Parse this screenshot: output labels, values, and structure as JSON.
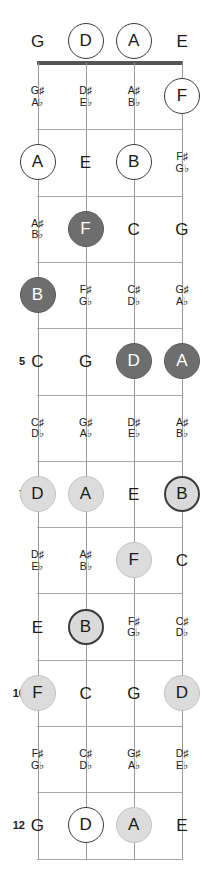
{
  "diagram": {
    "instrument": "4-string bass",
    "num_strings": 4,
    "num_frets": 12,
    "colors": {
      "nut": "#555555",
      "fret_line": "#a8a8a8",
      "string": "#9a9a9a",
      "text": "#1a1a1a",
      "marker_open_fill": "#ffffff",
      "marker_light_fill": "#dcdcdc",
      "marker_dark_fill": "#6e6e6e",
      "marker_border_dark": "#3a3a3a",
      "marker_dark_text": "#ffffff"
    }
  },
  "open_strings": [
    {
      "label": "G",
      "style": "plain"
    },
    {
      "label": "D",
      "style": "open"
    },
    {
      "label": "A",
      "style": "open"
    },
    {
      "label": "E",
      "style": "plain"
    }
  ],
  "fret_numbers": [
    {
      "fret": 5,
      "label": "5"
    },
    {
      "fret": 7,
      "label": "7"
    },
    {
      "fret": 10,
      "label": "10"
    },
    {
      "fret": 12,
      "label": "12"
    }
  ],
  "frets": [
    {
      "fret": 1,
      "notes": [
        {
          "string": 1,
          "label": "G♯\nA♭",
          "style": "accidental"
        },
        {
          "string": 2,
          "label": "D♯\nE♭",
          "style": "accidental"
        },
        {
          "string": 3,
          "label": "A♯\nB♭",
          "style": "accidental"
        },
        {
          "string": 4,
          "label": "F",
          "style": "open"
        }
      ]
    },
    {
      "fret": 2,
      "notes": [
        {
          "string": 1,
          "label": "A",
          "style": "open"
        },
        {
          "string": 2,
          "label": "E",
          "style": "plain"
        },
        {
          "string": 3,
          "label": "B",
          "style": "open"
        },
        {
          "string": 4,
          "label": "F♯\nG♭",
          "style": "accidental"
        }
      ]
    },
    {
      "fret": 3,
      "notes": [
        {
          "string": 1,
          "label": "A♯\nB♭",
          "style": "accidental"
        },
        {
          "string": 2,
          "label": "F",
          "style": "dark"
        },
        {
          "string": 3,
          "label": "C",
          "style": "plain"
        },
        {
          "string": 4,
          "label": "G",
          "style": "plain"
        }
      ]
    },
    {
      "fret": 4,
      "notes": [
        {
          "string": 1,
          "label": "B",
          "style": "dark"
        },
        {
          "string": 2,
          "label": "F♯\nG♭",
          "style": "accidental"
        },
        {
          "string": 3,
          "label": "C♯\nD♭",
          "style": "accidental"
        },
        {
          "string": 4,
          "label": "G♯\nA♭",
          "style": "accidental"
        }
      ]
    },
    {
      "fret": 5,
      "notes": [
        {
          "string": 1,
          "label": "C",
          "style": "plain"
        },
        {
          "string": 2,
          "label": "G",
          "style": "plain"
        },
        {
          "string": 3,
          "label": "D",
          "style": "dark"
        },
        {
          "string": 4,
          "label": "A",
          "style": "dark"
        }
      ]
    },
    {
      "fret": 6,
      "notes": [
        {
          "string": 1,
          "label": "C♯\nD♭",
          "style": "accidental"
        },
        {
          "string": 2,
          "label": "G♯\nA♭",
          "style": "accidental"
        },
        {
          "string": 3,
          "label": "D♯\nE♭",
          "style": "accidental"
        },
        {
          "string": 4,
          "label": "A♯\nB♭",
          "style": "accidental"
        }
      ]
    },
    {
      "fret": 7,
      "notes": [
        {
          "string": 1,
          "label": "D",
          "style": "light"
        },
        {
          "string": 2,
          "label": "A",
          "style": "light"
        },
        {
          "string": 3,
          "label": "E",
          "style": "plain"
        },
        {
          "string": 4,
          "label": "B",
          "style": "light-ring"
        }
      ]
    },
    {
      "fret": 8,
      "notes": [
        {
          "string": 1,
          "label": "D♯\nE♭",
          "style": "accidental"
        },
        {
          "string": 2,
          "label": "A♯\nB♭",
          "style": "accidental"
        },
        {
          "string": 3,
          "label": "F",
          "style": "light"
        },
        {
          "string": 4,
          "label": "C",
          "style": "plain"
        }
      ]
    },
    {
      "fret": 9,
      "notes": [
        {
          "string": 1,
          "label": "E",
          "style": "plain"
        },
        {
          "string": 2,
          "label": "B",
          "style": "light-ring"
        },
        {
          "string": 3,
          "label": "F♯\nG♭",
          "style": "accidental"
        },
        {
          "string": 4,
          "label": "C♯\nD♭",
          "style": "accidental"
        }
      ]
    },
    {
      "fret": 10,
      "notes": [
        {
          "string": 1,
          "label": "F",
          "style": "light"
        },
        {
          "string": 2,
          "label": "C",
          "style": "plain"
        },
        {
          "string": 3,
          "label": "G",
          "style": "plain"
        },
        {
          "string": 4,
          "label": "D",
          "style": "light"
        }
      ]
    },
    {
      "fret": 11,
      "notes": [
        {
          "string": 1,
          "label": "F♯\nG♭",
          "style": "accidental"
        },
        {
          "string": 2,
          "label": "C♯\nD♭",
          "style": "accidental"
        },
        {
          "string": 3,
          "label": "G♯\nA♭",
          "style": "accidental"
        },
        {
          "string": 4,
          "label": "D♯\nE♭",
          "style": "accidental"
        }
      ]
    },
    {
      "fret": 12,
      "notes": [
        {
          "string": 1,
          "label": "G",
          "style": "plain"
        },
        {
          "string": 2,
          "label": "D",
          "style": "open"
        },
        {
          "string": 3,
          "label": "A",
          "style": "light"
        },
        {
          "string": 4,
          "label": "E",
          "style": "plain"
        }
      ]
    }
  ]
}
